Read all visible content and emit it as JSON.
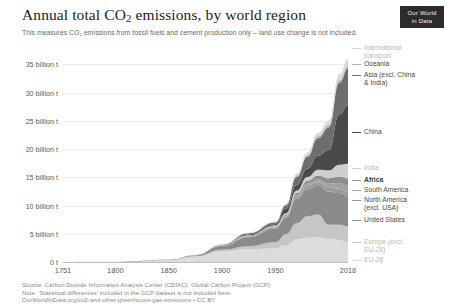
{
  "header": {
    "title_main": "Annual total CO",
    "title_sub": "2",
    "title_rest": " emissions, by world region",
    "subtitle": "This measures CO₂ emissions from fossil fuels and cement production only – land use change is not included.",
    "logo_line1": "Our World",
    "logo_line2": "in Data"
  },
  "footer": {
    "line1": "Source: Carbon Dioxide Information Analysis Center (CDIAC); Global Carbon Project (GCP)",
    "line2": "Note: 'Statistical differences' included in the GCP dataset is not included here.",
    "line3": "OurWorldInData.org/co2-and-other-greenhouse-gas-emissions • CC BY"
  },
  "legend": [
    {
      "label": "International\ntransport",
      "color": "#d8d8d8",
      "top": 0,
      "muted": true,
      "bold": false
    },
    {
      "label": "Oceania",
      "color": "#b4b4b4",
      "top": 16,
      "muted": false,
      "bold": false
    },
    {
      "label": "Asia (excl. China\n& India)",
      "color": "#6e6e6e",
      "top": 27,
      "muted": false,
      "bold": false
    },
    {
      "label": "China",
      "color": "#4a4a4a",
      "top": 84,
      "muted": false,
      "bold": false
    },
    {
      "label": "India",
      "color": "#cfcfcf",
      "top": 120,
      "muted": true,
      "bold": false
    },
    {
      "label": "Africa",
      "color": "#8e8e8e",
      "top": 132,
      "muted": false,
      "bold": true
    },
    {
      "label": "South America",
      "color": "#a3a3a3",
      "top": 142,
      "muted": false,
      "bold": false
    },
    {
      "label": "North America\n(excl. USA)",
      "color": "#9a9a9a",
      "top": 152,
      "muted": false,
      "bold": false
    },
    {
      "label": "United States",
      "color": "#8a8a8a",
      "top": 172,
      "muted": false,
      "bold": false
    },
    {
      "label": "Europe (excl.\nEU-28)",
      "color": "#c6c6c6",
      "top": 194,
      "muted": true,
      "bold": false
    },
    {
      "label": "EU-28",
      "color": "#dcdcdc",
      "top": 212,
      "muted": true,
      "bold": false
    }
  ],
  "chart_data": {
    "type": "area",
    "stacked": true,
    "title": "Annual total CO2 emissions, by world region",
    "subtitle": "This measures CO₂ emissions from fossil fuels and cement production only – land use change is not included.",
    "xlabel": "",
    "ylabel": "",
    "unit": "tonnes",
    "grid": true,
    "legend_position": "right",
    "xlim": [
      1751,
      2018
    ],
    "ylim": [
      0,
      37000000000
    ],
    "ytick_labels": [
      "0 t",
      "5 billion t",
      "10 billion t",
      "15 billion t",
      "20 billion t",
      "25 billion t",
      "30 billion t",
      "35 billion t"
    ],
    "ytick_values": [
      0,
      5000000000,
      10000000000,
      15000000000,
      20000000000,
      25000000000,
      30000000000,
      35000000000
    ],
    "xtick_labels": [
      "1751",
      "1800",
      "1850",
      "1900",
      "1950",
      "2018"
    ],
    "xtick_values": [
      1751,
      1800,
      1850,
      1900,
      1950,
      2018
    ],
    "x": [
      1751,
      1800,
      1850,
      1875,
      1900,
      1925,
      1950,
      1960,
      1970,
      1980,
      1990,
      2000,
      2010,
      2018
    ],
    "series": [
      {
        "name": "EU-28",
        "color": "#dcdcdc",
        "values": [
          0.003,
          0.03,
          0.33,
          0.95,
          1.85,
          2.3,
          2.4,
          3.0,
          4.0,
          4.3,
          4.4,
          4.1,
          3.9,
          3.5
        ]
      },
      {
        "name": "Europe (excl. EU-28)",
        "color": "#c6c6c6",
        "values": [
          0,
          0.001,
          0.02,
          0.09,
          0.33,
          0.5,
          1.1,
          1.9,
          2.9,
          3.8,
          4.0,
          2.5,
          2.7,
          2.8
        ]
      },
      {
        "name": "United States",
        "color": "#8a8a8a",
        "values": [
          0,
          0.0002,
          0.02,
          0.15,
          0.66,
          1.6,
          2.4,
          2.9,
          4.3,
          4.8,
          5.1,
          5.9,
          5.6,
          5.3
        ]
      },
      {
        "name": "North America (excl. USA)",
        "color": "#9a9a9a",
        "values": [
          0,
          0,
          0.002,
          0.01,
          0.05,
          0.12,
          0.19,
          0.25,
          0.42,
          0.55,
          0.61,
          0.73,
          0.78,
          0.8
        ]
      },
      {
        "name": "South America",
        "color": "#a3a3a3",
        "values": [
          0,
          0,
          0.001,
          0.004,
          0.02,
          0.05,
          0.08,
          0.13,
          0.25,
          0.4,
          0.5,
          0.7,
          1.0,
          1.1
        ]
      },
      {
        "name": "Africa",
        "color": "#8e8e8e",
        "values": [
          0,
          0,
          0.001,
          0.005,
          0.03,
          0.07,
          0.11,
          0.18,
          0.33,
          0.55,
          0.72,
          0.9,
          1.15,
          1.3
        ]
      },
      {
        "name": "India",
        "color": "#cfcfcf",
        "values": [
          0,
          0,
          0.001,
          0.01,
          0.05,
          0.09,
          0.2,
          0.29,
          0.45,
          0.65,
          1.0,
          1.4,
          2.1,
          2.6
        ]
      },
      {
        "name": "China",
        "color": "#4a4a4a",
        "values": [
          0,
          0,
          0.001,
          0.01,
          0.03,
          0.15,
          0.2,
          0.8,
          1.0,
          1.5,
          2.5,
          3.6,
          8.9,
          10.3
        ]
      },
      {
        "name": "Asia (excl. China & India)",
        "color": "#6e6e6e",
        "values": [
          0,
          0,
          0.001,
          0.01,
          0.05,
          0.2,
          0.3,
          0.6,
          1.4,
          2.1,
          3.1,
          4.0,
          5.6,
          6.5
        ]
      },
      {
        "name": "Oceania",
        "color": "#b4b4b4",
        "values": [
          0,
          0,
          0.001,
          0.005,
          0.02,
          0.04,
          0.06,
          0.1,
          0.17,
          0.24,
          0.32,
          0.42,
          0.49,
          0.5
        ]
      },
      {
        "name": "International transport",
        "color": "#d8d8d8",
        "values": [
          0,
          0,
          0.002,
          0.01,
          0.04,
          0.08,
          0.13,
          0.2,
          0.4,
          0.5,
          0.6,
          0.8,
          1.0,
          1.2
        ]
      }
    ],
    "total_2018_billion_t": 36.0,
    "annotation": "Emissions remain near zero until ~1850, rise steadily through the industrial era, and accelerate sharply after 1950."
  }
}
